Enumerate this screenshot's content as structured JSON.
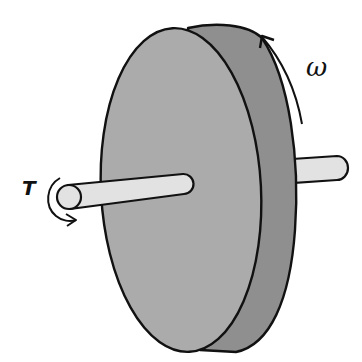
{
  "diagram": {
    "labels": {
      "torque": "T",
      "angular_velocity": "ω"
    },
    "components": [
      "disk-front-face",
      "disk-rim",
      "shaft-front",
      "shaft-back",
      "torque-arrow",
      "omega-arrow"
    ],
    "colors": {
      "disk_face": "#a9a9a9",
      "disk_rim": "#8e8e8e",
      "shaft": "#e2e2e2",
      "outline": "#111111",
      "background": "#ffffff"
    }
  }
}
